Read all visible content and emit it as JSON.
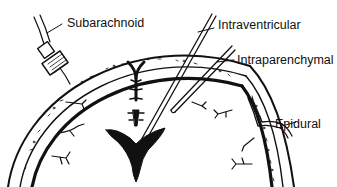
{
  "diagram": {
    "labels": {
      "subarachnoid": "Subarachnoid",
      "intraventricular": "Intraventricular",
      "intraparenchymal": "Intraparenchymal",
      "epidural": "Epidural"
    },
    "colors": {
      "ink": "#111111",
      "background": "#ffffff"
    }
  }
}
